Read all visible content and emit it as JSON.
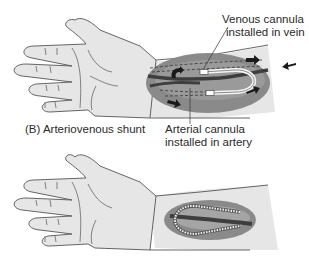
{
  "panels": [
    {
      "id": "B",
      "caption": "(B) Arteriovenous shunt",
      "callouts": {
        "venous": {
          "line1": "Venous cannula",
          "line2": "installed in vein"
        },
        "arterial": {
          "line1": "Arterial cannula",
          "line2": "installed in artery"
        }
      },
      "flow_arrows": [
        "upper-left-curve",
        "upper-right",
        "lower-left",
        "lower-right",
        "external-left-pointing"
      ]
    },
    {
      "id": "C",
      "caption": "",
      "description": "Arteriovenous fistula with looped graft on forearm"
    }
  ],
  "colors": {
    "skin": "#e6e6e6",
    "outline": "#555555",
    "patch_dark": "#7d7d7d",
    "patch_light": "#a9a9a9",
    "vessel": "#3e3e3e",
    "arrow": "#1a1a1a"
  }
}
